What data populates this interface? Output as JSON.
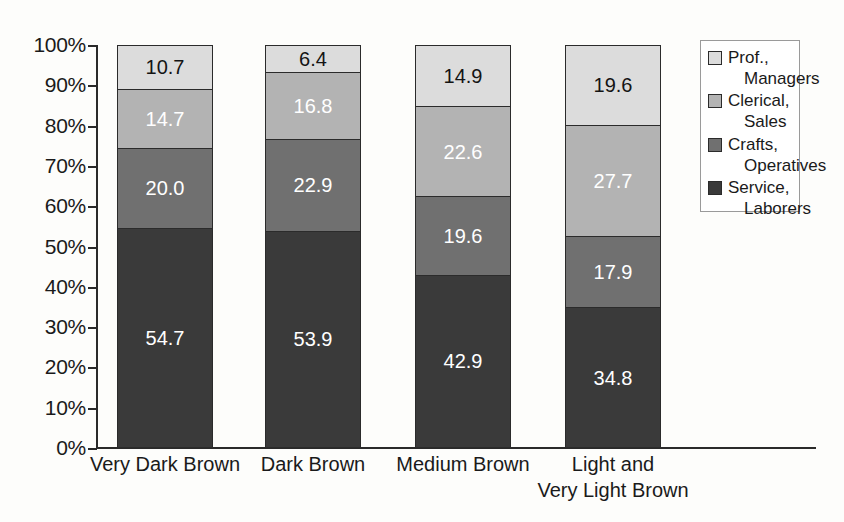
{
  "chart_data": {
    "type": "bar",
    "subtype": "stacked-bar-100-percent",
    "title": "",
    "subtitle": "",
    "xlabel": "",
    "ylabel": "",
    "categories": [
      "Very Dark Brown",
      "Dark Brown",
      "Medium Brown",
      "Light and\nVery Light Brown"
    ],
    "series": [
      {
        "name": "Prof.,\nManagers",
        "legend_label_line1": "Prof.,",
        "legend_label_line2": "Managers",
        "color": "#dcdcdc",
        "label_color": "#141414",
        "values": [
          10.7,
          6.4,
          14.9,
          19.6
        ]
      },
      {
        "name": "Clerical,\nSales",
        "legend_label_line1": "Clerical,",
        "legend_label_line2": "Sales",
        "color": "#b3b3b3",
        "label_color": "#ffffff",
        "values": [
          14.7,
          16.8,
          22.6,
          27.7
        ]
      },
      {
        "name": "Crafts,\nOperatives",
        "legend_label_line1": "Crafts,",
        "legend_label_line2": "Operatives",
        "color": "#707070",
        "label_color": "#ffffff",
        "values": [
          20.0,
          22.9,
          19.6,
          17.9
        ]
      },
      {
        "name": "Service,\nLaborers",
        "legend_label_line1": "Service,",
        "legend_label_line2": "Laborers",
        "color": "#3a3a3a",
        "label_color": "#ffffff",
        "values": [
          54.7,
          53.9,
          42.9,
          34.8
        ]
      }
    ],
    "stack_order_top_to_bottom": [
      "Prof., Managers",
      "Clerical, Sales",
      "Crafts, Operatives",
      "Service, Laborers"
    ],
    "ylim": [
      0,
      100
    ],
    "ytick_labels": [
      "100%",
      "90%",
      "80%",
      "70%",
      "60%",
      "50%",
      "40%",
      "30%",
      "20%",
      "10%",
      "0%"
    ],
    "ytick_values": [
      100,
      90,
      80,
      70,
      60,
      50,
      40,
      30,
      20,
      10,
      0
    ],
    "grid": false,
    "legend_position": "top-right",
    "data_labels": {
      "very_dark_brown": {
        "prof_managers": "10.7",
        "clerical_sales": "14.7",
        "crafts_operatives": "20.0",
        "service_laborers": "54.7"
      },
      "dark_brown": {
        "prof_managers": "6.4",
        "clerical_sales": "16.8",
        "crafts_operatives": "22.9",
        "service_laborers": "53.9"
      },
      "medium_brown": {
        "prof_managers": "14.9",
        "clerical_sales": "22.6",
        "crafts_operatives": "19.6",
        "service_laborers": "42.9"
      },
      "light_very_light_brown": {
        "prof_managers": "19.6",
        "clerical_sales": "27.7",
        "crafts_operatives": "17.9",
        "service_laborers": "34.8"
      }
    }
  },
  "axis": {
    "y_labels": [
      "100%",
      "90%",
      "80%",
      "70%",
      "60%",
      "50%",
      "40%",
      "30%",
      "20%",
      "10%",
      "0%"
    ],
    "x_labels": [
      "Very Dark Brown",
      "Dark Brown",
      "Medium Brown",
      "Light and\nVery Light Brown"
    ]
  },
  "legend": {
    "entries": [
      {
        "line1": "Prof.,",
        "line2": "Managers",
        "swatch": "#dcdcdc"
      },
      {
        "line1": "Clerical,",
        "line2": "Sales",
        "swatch": "#b3b3b3"
      },
      {
        "line1": "Crafts,",
        "line2": "Operatives",
        "swatch": "#707070"
      },
      {
        "line1": "Service,",
        "line2": "Laborers",
        "swatch": "#3a3a3a"
      }
    ]
  },
  "colors": {
    "axis": "#2a2a2a",
    "bar_border": "#2b2b2b",
    "legend_border": "#9a9a9a",
    "background": "#fdfdfb",
    "text": "#1a1a1a"
  }
}
